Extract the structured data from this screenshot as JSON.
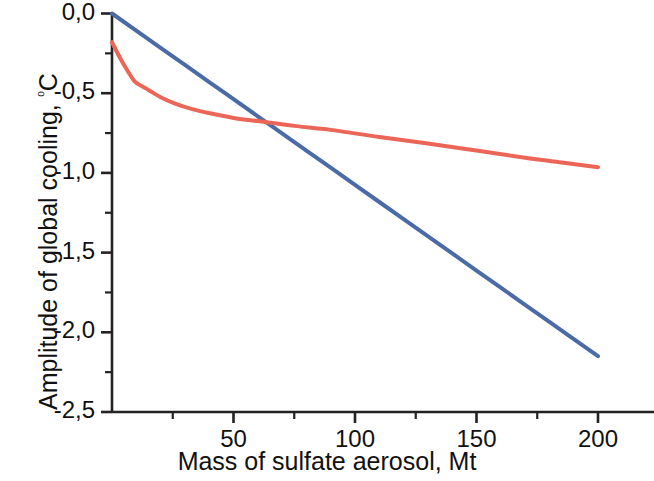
{
  "chart_data": {
    "type": "line",
    "title": "",
    "xlabel": "Mass of sulfate aerosol, Mt",
    "ylabel": "Amplitude of global cooling, ⁰C",
    "ylabel_text": "Amplitude of global cooling, ",
    "ylabel_degree": "⁰",
    "ylabel_unit": "C",
    "xlim": [
      0,
      217
    ],
    "ylim": [
      -2.5,
      0.0
    ],
    "grid": false,
    "legend": "none",
    "decimal_separator": ",",
    "x_ticks": [
      50,
      100,
      150,
      200
    ],
    "x_tick_labels": [
      "50",
      "100",
      "150",
      "200"
    ],
    "x_minor_ticks": [
      25,
      75,
      125,
      175
    ],
    "y_ticks": [
      0.0,
      -0.5,
      -1.0,
      -1.5,
      -2.0,
      -2.5
    ],
    "y_tick_labels": [
      "0,0",
      "-0,5",
      "-1,0",
      "-1,5",
      "-2,0",
      "-2,5"
    ],
    "y_minor_ticks": [
      -0.25,
      -0.75,
      -1.25,
      -1.75,
      -2.25
    ],
    "series": [
      {
        "name": "linear-response",
        "color": "#4a6aa8",
        "width": 4,
        "x": [
          0,
          20,
          40,
          60,
          80,
          100,
          120,
          140,
          160,
          180,
          200
        ],
        "values": [
          0.0,
          -0.215,
          -0.43,
          -0.645,
          -0.86,
          -1.075,
          -1.29,
          -1.505,
          -1.72,
          -1.935,
          -2.15
        ]
      },
      {
        "name": "saturating-response",
        "color": "#ec6658",
        "width": 4,
        "x": [
          0,
          3,
          6,
          9,
          11,
          15,
          20,
          26,
          33,
          40,
          50,
          60,
          75,
          90,
          110,
          130,
          150,
          170,
          185,
          200
        ],
        "values": [
          -0.18,
          -0.27,
          -0.35,
          -0.42,
          -0.445,
          -0.48,
          -0.525,
          -0.565,
          -0.6,
          -0.625,
          -0.655,
          -0.675,
          -0.705,
          -0.73,
          -0.775,
          -0.815,
          -0.86,
          -0.905,
          -0.935,
          -0.965
        ]
      }
    ]
  },
  "axes": {
    "x_axis_name": "x-axis",
    "y_axis_name": "y-axis"
  }
}
